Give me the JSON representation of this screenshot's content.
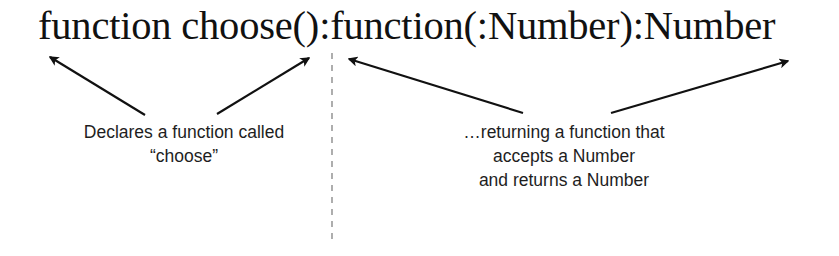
{
  "code": {
    "signature": "function choose():function(:Number):Number"
  },
  "annotations": {
    "left": {
      "lines": [
        "Declares a function called",
        "“choose”"
      ]
    },
    "right": {
      "lines": [
        "…returning a function that",
        "accepts a Number",
        "and returns a Number"
      ]
    }
  },
  "divider": {
    "style": "dashed",
    "color": "#9a9a9a"
  },
  "arrows": [
    {
      "name": "arrow-to-function-keyword",
      "from": [
        145,
        115
      ],
      "to": [
        48,
        56
      ]
    },
    {
      "name": "arrow-to-choose-parens",
      "from": [
        217,
        114
      ],
      "to": [
        311,
        57
      ]
    },
    {
      "name": "arrow-to-return-function",
      "from": [
        523,
        113
      ],
      "to": [
        347,
        59
      ]
    },
    {
      "name": "arrow-to-return-number",
      "from": [
        611,
        113
      ],
      "to": [
        790,
        60
      ]
    }
  ],
  "colors": {
    "text": "#111111",
    "arrow": "#111111",
    "background": "#ffffff"
  }
}
